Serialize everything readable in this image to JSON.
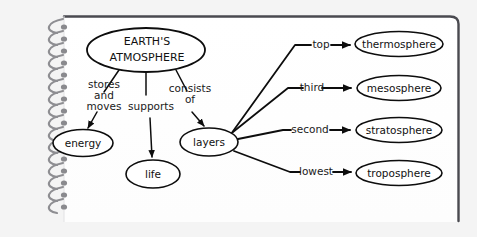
{
  "page": {
    "media": "spiral-bound-notebook-page",
    "background_color": "#f4f4f4",
    "paper_color": "#ffffff",
    "ink_color": "#0d0d0d",
    "binding_color": "#8e8e92",
    "width": 477,
    "height": 237
  },
  "diagram": {
    "type": "concept-map",
    "root": {
      "id": "earths-atmosphere",
      "label_line1": "EARTH'S",
      "label_line2": "ATMOSPHERE",
      "shape": "ellipse",
      "cx": 146,
      "cy": 50,
      "rx": 59,
      "ry": 22
    },
    "nodes": [
      {
        "id": "energy",
        "label": "energy",
        "shape": "ellipse",
        "cx": 83,
        "cy": 143,
        "rx": 30,
        "ry": 13.5
      },
      {
        "id": "life",
        "label": "life",
        "shape": "ellipse",
        "cx": 153,
        "cy": 174,
        "rx": 27,
        "ry": 14
      },
      {
        "id": "layers",
        "label": "layers",
        "shape": "ellipse",
        "cx": 209,
        "cy": 142,
        "rx": 29,
        "ry": 14
      },
      {
        "id": "thermosphere",
        "label": "thermosphere",
        "shape": "ellipse",
        "cx": 399,
        "cy": 44,
        "rx": 44,
        "ry": 12.5
      },
      {
        "id": "mesosphere",
        "label": "mesosphere",
        "shape": "ellipse",
        "cx": 399,
        "cy": 88,
        "rx": 42,
        "ry": 12.5
      },
      {
        "id": "stratosphere",
        "label": "stratosphere",
        "shape": "ellipse",
        "cx": 399,
        "cy": 130,
        "rx": 43,
        "ry": 12.5
      },
      {
        "id": "troposphere",
        "label": "troposphere",
        "shape": "ellipse",
        "cx": 399,
        "cy": 173,
        "rx": 43,
        "ry": 12.5
      }
    ],
    "links": [
      {
        "id": "link-stores-and-moves",
        "from": "earths-atmosphere",
        "to": "energy",
        "label_line1": "stores",
        "label_line2": "and",
        "label_line3": "moves",
        "arrow": true
      },
      {
        "id": "link-supports",
        "from": "earths-atmosphere",
        "to": "life",
        "label_line1": "supports",
        "arrow": true
      },
      {
        "id": "link-consists-of",
        "from": "earths-atmosphere",
        "to": "layers",
        "label_line1": "consists",
        "label_line2": "of",
        "arrow": true
      },
      {
        "id": "link-top",
        "from": "layers",
        "to": "thermosphere",
        "label_line1": "top",
        "arrow": true
      },
      {
        "id": "link-third",
        "from": "layers",
        "to": "mesosphere",
        "label_line1": "third",
        "arrow": true
      },
      {
        "id": "link-second",
        "from": "layers",
        "to": "stratosphere",
        "label_line1": "second",
        "arrow": true
      },
      {
        "id": "link-lowest",
        "from": "layers",
        "to": "troposphere",
        "label_line1": "lowest",
        "arrow": true
      }
    ]
  }
}
